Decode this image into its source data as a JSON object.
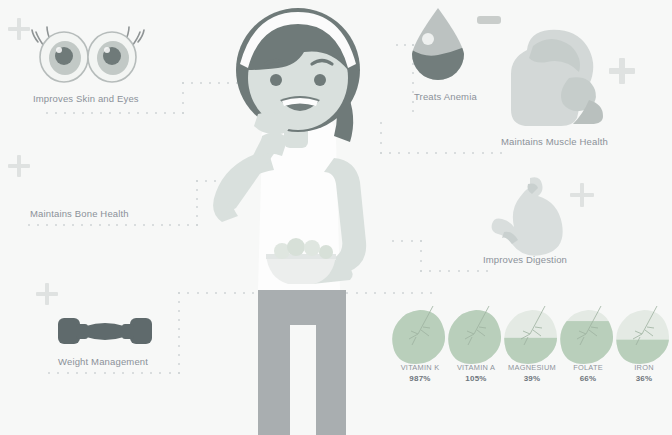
{
  "meta": {
    "background_color": "#f7f8f7",
    "label_color": "#8b9199",
    "accent_plus_color": "#dfe2e1",
    "leaf_fill_color": "#b9cfbb",
    "leaf_empty_color": "#e4eae4",
    "figure_skin_color": "#d9e0dd",
    "figure_hair_color": "#6f7a79",
    "figure_pants_color": "#a9aeb0",
    "icon_gray": "#8f9495"
  },
  "benefits": [
    {
      "id": "skin-eyes",
      "label": "Improves Skin and Eyes",
      "icon": "eyes-icon",
      "sign": "plus"
    },
    {
      "id": "bone",
      "label": "Maintains Bone Health",
      "icon": "none",
      "sign": "plus"
    },
    {
      "id": "weight",
      "label": "Weight Management",
      "icon": "dumbbell-icon",
      "sign": "plus"
    },
    {
      "id": "anemia",
      "label": "Treats Anemia",
      "icon": "blood-drop-icon",
      "sign": "minus"
    },
    {
      "id": "muscle",
      "label": "Maintains Muscle Health",
      "icon": "bicep-icon",
      "sign": "plus"
    },
    {
      "id": "digestion",
      "label": "Improves Digestion",
      "icon": "stomach-icon",
      "sign": "plus"
    }
  ],
  "chart_data": {
    "type": "bar",
    "title": "",
    "xlabel": "",
    "ylabel": "% Daily Value",
    "categories": [
      "VITAMIN K",
      "VITAMIN A",
      "MAGNESIUM",
      "FOLATE",
      "IRON"
    ],
    "values": [
      987,
      105,
      39,
      66,
      36
    ],
    "value_labels": [
      "987%",
      "105%",
      "39%",
      "66%",
      "36%"
    ],
    "fill_fractions": [
      1.0,
      1.0,
      0.39,
      0.66,
      0.36
    ],
    "units": "percent",
    "glyph": "leaf",
    "legend": "none",
    "grid": false,
    "ylim": [
      0,
      100
    ]
  },
  "figure": {
    "name": "girl-eating-figure"
  }
}
